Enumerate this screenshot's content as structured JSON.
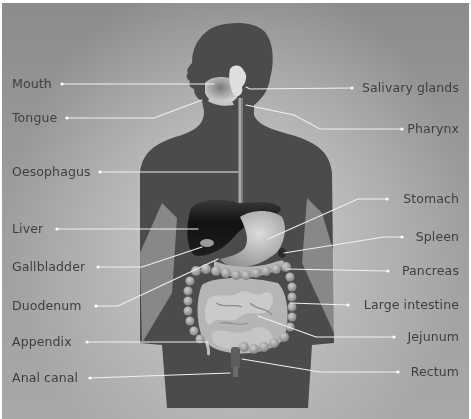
{
  "diagram": {
    "type": "anatomical labeled diagram",
    "colors": {
      "background_edge": "#8c8c8c",
      "background_glow": "#e6e6e6",
      "silhouette": "#4b4b4b",
      "liver": "#1c1c1c",
      "organs_light": "#bdbdbd",
      "leader_lines": "#f2f2f2",
      "label_text": "#3f3f3f"
    },
    "labels_left": [
      {
        "id": "mouth",
        "text": "Mouth"
      },
      {
        "id": "tongue",
        "text": "Tongue"
      },
      {
        "id": "oesophagus",
        "text": "Oesophagus"
      },
      {
        "id": "liver",
        "text": "Liver"
      },
      {
        "id": "gallbladder",
        "text": "Gallbladder"
      },
      {
        "id": "duodenum",
        "text": "Duodenum"
      },
      {
        "id": "appendix",
        "text": "Appendix"
      },
      {
        "id": "anal-canal",
        "text": "Anal canal"
      }
    ],
    "labels_right": [
      {
        "id": "salivary-glands",
        "text": "Salivary glands"
      },
      {
        "id": "pharynx",
        "text": "Pharynx"
      },
      {
        "id": "stomach",
        "text": "Stomach"
      },
      {
        "id": "spleen",
        "text": "Spleen"
      },
      {
        "id": "pancreas",
        "text": "Pancreas"
      },
      {
        "id": "large-intestine",
        "text": "Large intestine"
      },
      {
        "id": "jejunum",
        "text": "Jejunum"
      },
      {
        "id": "rectum",
        "text": "Rectum"
      }
    ]
  }
}
